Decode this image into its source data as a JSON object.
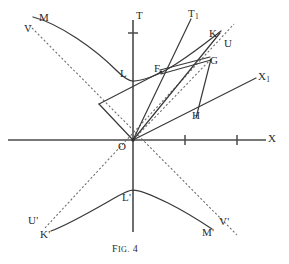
{
  "figure": {
    "caption_prefix": "F",
    "caption_rest": "IG.",
    "caption_number": "4",
    "caption_full": "FIG. 4",
    "background_color": "#ffffff",
    "ink_color": "#2b2b2b",
    "axis_color": "#4a4a4a",
    "curve_color": "#3a3a3a",
    "dashed_color": "#6a6a6a"
  },
  "axes": [
    {
      "name": "x-axis",
      "label": "X",
      "sub": "",
      "label_x": 268,
      "label_y": 133
    },
    {
      "name": "t-axis",
      "label": "T",
      "sub": "",
      "label_x": 136,
      "label_y": 10
    },
    {
      "name": "x1-axis",
      "label": "X",
      "sub": "1",
      "label_x": 258,
      "label_y": 71
    },
    {
      "name": "t1-axis",
      "label": "T",
      "sub": "1",
      "label_x": 188,
      "label_y": 8
    }
  ],
  "points": [
    {
      "name": "point-M",
      "label": "M",
      "sub": "",
      "x": 39,
      "y": 12
    },
    {
      "name": "point-V",
      "label": "V",
      "sub": "",
      "x": 24,
      "y": 23
    },
    {
      "name": "point-L",
      "label": "L",
      "sub": "",
      "x": 120,
      "y": 68
    },
    {
      "name": "point-F",
      "label": "F",
      "sub": "",
      "x": 154,
      "y": 66
    },
    {
      "name": "point-K",
      "label": "K",
      "sub": "",
      "x": 209,
      "y": 29
    },
    {
      "name": "point-U",
      "label": "U",
      "sub": "",
      "x": 224,
      "y": 38
    },
    {
      "name": "point-G",
      "label": "G",
      "sub": "",
      "x": 209,
      "y": 55
    },
    {
      "name": "point-H",
      "label": "H",
      "sub": "",
      "x": 192,
      "y": 110
    },
    {
      "name": "point-O",
      "label": "O",
      "sub": "",
      "x": 118,
      "y": 141
    },
    {
      "name": "point-L-prime",
      "label": "L'",
      "sub": "",
      "x": 122,
      "y": 192
    },
    {
      "name": "point-U-prime",
      "label": "U'",
      "sub": "",
      "x": 28,
      "y": 215
    },
    {
      "name": "point-K-prime",
      "label": "K'",
      "sub": "",
      "x": 40,
      "y": 229
    },
    {
      "name": "point-M-prime",
      "label": "M'",
      "sub": "",
      "x": 202,
      "y": 227
    },
    {
      "name": "point-V-prime",
      "label": "V'",
      "sub": "",
      "x": 219,
      "y": 216
    }
  ],
  "geometry": {
    "origin": {
      "x": 133,
      "y": 140
    },
    "x_axis": {
      "x1": 8,
      "y1": 140,
      "x2": 266,
      "y2": 140
    },
    "t_axis": {
      "x1": 133,
      "y1": 20,
      "x2": 133,
      "y2": 232
    },
    "x_ticks": [
      {
        "x": 185
      },
      {
        "x": 237
      }
    ],
    "t_ticks": [
      {
        "y": 33
      }
    ],
    "x1_line": {
      "x1": 133,
      "y1": 140,
      "x2": 256,
      "y2": 78
    },
    "t1_line": {
      "x1": 133,
      "y1": 140,
      "x2": 191,
      "y2": 19
    },
    "upper_hyperbola": "M 33,17 C 60,24 95,49 116,70 C 124,78 129,81 133,81 C 141,81 158,76 176,64 C 196,51 212,38 221,31",
    "lower_hyperbola": "M 51,231 C 72,223 100,206 118,196 C 125,192 130,190 133,190 C 139,190 152,195 168,203 C 186,212 203,223 212,229",
    "asymptote_1": "M 29,25 L 237,235",
    "asymptote_2": "M 45,228 L 234,24",
    "segment_O_F": "M 133,140 L 168,68",
    "segment_O_K": "M 133,140 L 219,34",
    "segment_O_G": "M 133,140 L 213,58",
    "segment_F_G": "M 162,70 L 210,58",
    "segment_F_Gb": "M 163,73 L 210,60",
    "segment_G_H": "M 211,59 L 196,117",
    "segment_O_H": "M 133,140 L 196,117",
    "segment_left_wing": "M 100,104 L 133,140",
    "segment_left_wing2": "M 100,104 L 160,71",
    "segment_OU": "M 133,140 L 222,41"
  }
}
